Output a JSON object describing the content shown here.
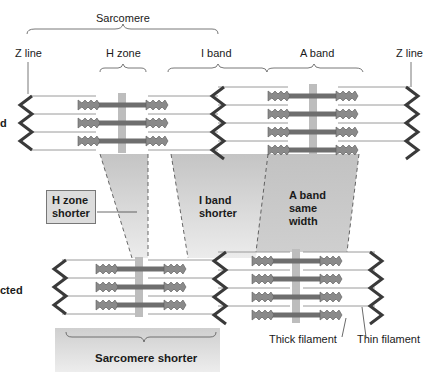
{
  "labels": {
    "sarcomere": "Sarcomere",
    "z_line_left": "Z line",
    "h_zone": "H zone",
    "i_band": "I band",
    "a_band": "A band",
    "z_line_right": "Z line",
    "relaxed_partial": "d",
    "contracted_partial": "cted",
    "h_zone_shorter_1": "H zone",
    "h_zone_shorter_2": "shorter",
    "i_band_shorter_1": "I band",
    "i_band_shorter_2": "shorter",
    "a_band_same_1": "A band",
    "a_band_same_2": "same",
    "a_band_same_3": "width",
    "thick_filament": "Thick filament",
    "thin_filament": "Thin filament",
    "sarcomere_shorter": "Sarcomere shorter"
  },
  "colors": {
    "thick_filament": "#6e6e6e",
    "myosin_heads": "#8a8a8a",
    "m_line": "#bdbdbd",
    "z_line": "#3a3a3a",
    "thin_filament": "#a8a8a8",
    "trapezoid_fill": "#c8c8c8",
    "box_fill": "#dcdcdc"
  }
}
